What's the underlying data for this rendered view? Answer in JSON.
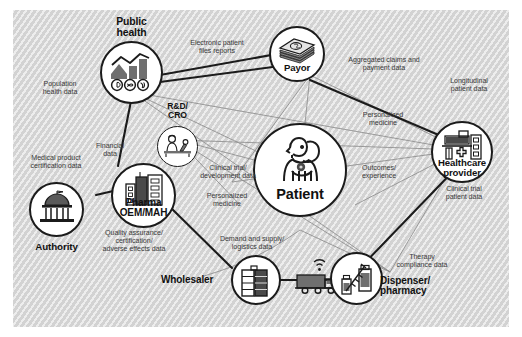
{
  "diagram": {
    "background_color": "#d7d7d7",
    "line_color_primary": "#1b1b1b",
    "line_color_secondary": "#8d8d8d"
  },
  "nodes": [
    {
      "id": "public-health",
      "label": "Public\nhealth",
      "label_line1": "Public",
      "label_line2": "health",
      "icon": "chart-growth-health-icon"
    },
    {
      "id": "payor",
      "label": "Payor",
      "label_line1": "Payor",
      "label_line2": "",
      "icon": "money-stack-icon"
    },
    {
      "id": "healthcare-provider",
      "label": "Healthcare\nprovider",
      "label_line1": "Healthcare",
      "label_line2": "provider",
      "icon": "hospital-building-icon"
    },
    {
      "id": "rnd-cro",
      "label": "R&D/\nCRO",
      "label_line1": "R&D/",
      "label_line2": "CRO",
      "icon": "researcher-microscope-icon"
    },
    {
      "id": "pharma-oem-mah",
      "label": "Pharma\nOEM/MAH",
      "label_line1": "Pharma",
      "label_line2": "OEM/MAH",
      "icon": "factory-building-icon"
    },
    {
      "id": "authority",
      "label": "Authority",
      "label_line1": "Authority",
      "label_line2": "",
      "icon": "government-building-icon"
    },
    {
      "id": "patient",
      "label": "Patient",
      "label_line1": "Patient",
      "label_line2": "",
      "icon": "patient-person-icon"
    },
    {
      "id": "wholesaler",
      "label": "Wholesaler",
      "label_line1": "Wholesaler",
      "label_line2": "",
      "icon": "warehouse-shelf-icon"
    },
    {
      "id": "dispenser-pharmacy",
      "label": "Dispenser/\npharmacy",
      "label_line1": "Dispenser/",
      "label_line2": "pharmacy",
      "icon": "syringe-vial-icon"
    },
    {
      "id": "logistics-truck",
      "label": "",
      "label_line1": "",
      "label_line2": "",
      "icon": "connected-truck-icon"
    }
  ],
  "edge_labels": [
    {
      "id": "electronic-patient-files",
      "line1": "Electronic patient",
      "line2": "files reports"
    },
    {
      "id": "aggregated-claims",
      "line1": "Aggregated claims and",
      "line2": "payment data"
    },
    {
      "id": "longitudinal-patient-data",
      "line1": "Longitudinal",
      "line2": "patient data"
    },
    {
      "id": "population-health-data",
      "line1": "Population",
      "line2": "health data"
    },
    {
      "id": "medical-product-certification",
      "line1": "Medical product",
      "line2": "certification data"
    },
    {
      "id": "financial-data",
      "line1": "Financial",
      "line2": "data"
    },
    {
      "id": "clinical-trial-development",
      "line1": "Clinical trial/",
      "line2": "development data"
    },
    {
      "id": "personalized-medicine-right",
      "line1": "Personalized",
      "line2": "medicine"
    },
    {
      "id": "personalized-medicine-left",
      "line1": "Personalized",
      "line2": "medicine"
    },
    {
      "id": "outcomes-experience",
      "line1": "Outcomes/",
      "line2": "experience"
    },
    {
      "id": "clinical-trial-patient-data",
      "line1": "Clinical trial",
      "line2": "patient data"
    },
    {
      "id": "quality-assurance",
      "line1": "Quality assurance/",
      "line2": "certification/",
      "line3": "adverse effects data"
    },
    {
      "id": "demand-supply-logistics",
      "line1": "Demand and supply/",
      "line2": "logistics data"
    },
    {
      "id": "therapy-compliance",
      "line1": "Therapy",
      "line2": "compliance data"
    }
  ]
}
